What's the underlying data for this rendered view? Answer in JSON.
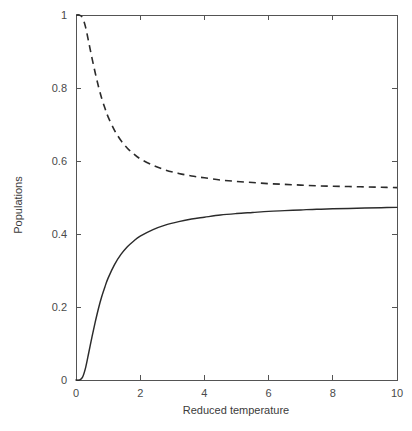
{
  "chart_data": {
    "type": "line",
    "title": "",
    "xlabel": "Reduced temperature",
    "ylabel": "Populations",
    "xlim": [
      0,
      10
    ],
    "ylim": [
      0,
      1
    ],
    "xticks": [
      0,
      2,
      4,
      6,
      8,
      10
    ],
    "xtick_labels": [
      "0",
      "2",
      "4",
      "6",
      "8",
      "10"
    ],
    "yticks": [
      0,
      0.2,
      0.4,
      0.6,
      0.8,
      1
    ],
    "ytick_labels": [
      "0",
      "0.2",
      "0.4",
      "0.6",
      "0.8",
      "1"
    ],
    "grid": false,
    "legend": null,
    "frame": "box",
    "tick_direction": "in",
    "colors": {
      "line": "#2b2b2b",
      "axis": "#545454",
      "background": "#ffffff"
    },
    "series": [
      {
        "name": "upper-level population",
        "style": "solid",
        "x": [
          0.0,
          0.1,
          0.2,
          0.3,
          0.4,
          0.5,
          0.6,
          0.7,
          0.8,
          0.9,
          1.0,
          1.2,
          1.4,
          1.6,
          1.8,
          2.0,
          2.4,
          2.8,
          3.2,
          3.6,
          4.0,
          4.5,
          5.0,
          5.5,
          6.0,
          6.5,
          7.0,
          7.5,
          8.0,
          8.5,
          9.0,
          9.5,
          10.0
        ],
        "values": [
          0.0,
          0.0,
          0.007,
          0.034,
          0.076,
          0.119,
          0.159,
          0.196,
          0.228,
          0.255,
          0.279,
          0.316,
          0.344,
          0.365,
          0.381,
          0.394,
          0.412,
          0.425,
          0.434,
          0.441,
          0.446,
          0.452,
          0.456,
          0.459,
          0.462,
          0.464,
          0.466,
          0.468,
          0.469,
          0.47,
          0.471,
          0.472,
          0.473
        ]
      },
      {
        "name": "lower-level population",
        "style": "dashed",
        "x": [
          0.0,
          0.1,
          0.2,
          0.3,
          0.4,
          0.5,
          0.6,
          0.7,
          0.8,
          0.9,
          1.0,
          1.2,
          1.4,
          1.6,
          1.8,
          2.0,
          2.4,
          2.8,
          3.2,
          3.6,
          4.0,
          4.5,
          5.0,
          5.5,
          6.0,
          6.5,
          7.0,
          7.5,
          8.0,
          8.5,
          9.0,
          9.5,
          10.0
        ],
        "values": [
          1.0,
          1.0,
          0.993,
          0.966,
          0.924,
          0.881,
          0.841,
          0.804,
          0.772,
          0.745,
          0.721,
          0.684,
          0.656,
          0.635,
          0.619,
          0.606,
          0.588,
          0.575,
          0.566,
          0.559,
          0.554,
          0.548,
          0.544,
          0.541,
          0.538,
          0.536,
          0.534,
          0.532,
          0.531,
          0.53,
          0.529,
          0.528,
          0.527
        ]
      }
    ]
  }
}
